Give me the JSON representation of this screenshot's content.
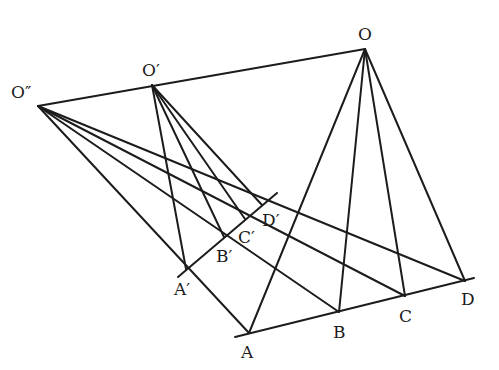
{
  "diagram": {
    "type": "projective-geometry-perspectivity",
    "line_color": "#1c1c1c",
    "background": "#ffffff",
    "points": {
      "O": {
        "label": "O",
        "x": 365,
        "y": 49
      },
      "O1": {
        "label": "O′",
        "x": 152,
        "y": 85
      },
      "O2": {
        "label": "O″",
        "x": 38,
        "y": 106
      },
      "A": {
        "label": "A",
        "x": 249,
        "y": 333
      },
      "B": {
        "label": "B",
        "x": 339,
        "y": 312
      },
      "C": {
        "label": "C",
        "x": 405,
        "y": 296
      },
      "D": {
        "label": "D",
        "x": 465,
        "y": 281
      },
      "A1": {
        "label": "A′",
        "x": 186,
        "y": 269
      },
      "B1": {
        "label": "B′",
        "x": 224,
        "y": 237
      },
      "C1": {
        "label": "C′",
        "x": 245,
        "y": 219
      },
      "D1": {
        "label": "D′",
        "x": 262,
        "y": 205
      }
    },
    "labels": {
      "O": {
        "text": "O",
        "x": 358,
        "y": 40
      },
      "O1": {
        "text": "O′",
        "x": 142,
        "y": 76
      },
      "O2": {
        "text": "O″",
        "x": 11,
        "y": 98
      },
      "A": {
        "text": "A",
        "x": 241,
        "y": 358
      },
      "B": {
        "text": "B",
        "x": 333,
        "y": 338
      },
      "C": {
        "text": "C",
        "x": 399,
        "y": 322
      },
      "D": {
        "text": "D",
        "x": 461,
        "y": 305
      },
      "A1": {
        "text": "A′",
        "x": 174,
        "y": 295
      },
      "B1": {
        "text": "B′",
        "x": 216,
        "y": 262
      },
      "C1": {
        "text": "C′",
        "x": 238,
        "y": 243
      },
      "D1": {
        "text": "D′",
        "x": 262,
        "y": 226
      }
    },
    "lines": {
      "center_axis": {
        "x1": 38,
        "y1": 106,
        "x2": 365,
        "y2": 49
      },
      "base_line": {
        "x1": 235,
        "y1": 337,
        "x2": 474,
        "y2": 278
      },
      "image_line": {
        "x1": 178,
        "y1": 277,
        "x2": 277,
        "y2": 193
      }
    }
  }
}
